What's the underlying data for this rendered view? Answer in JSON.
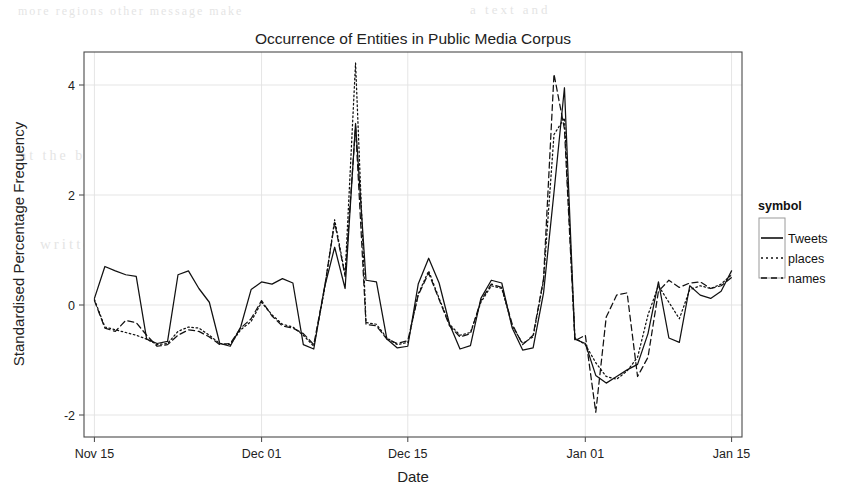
{
  "chart_data": {
    "type": "line",
    "title": "Occurrence of Entities in Public Media Corpus",
    "xlabel": "Date",
    "ylabel": "Standardised Percentage Frequency",
    "grid": true,
    "legend_position": "right",
    "legend_title": "symbol",
    "ylim": [
      -2.4,
      4.6
    ],
    "yticks": [
      -2,
      0,
      2,
      4
    ],
    "ytick_labels": [
      "-2",
      "0",
      "2",
      "4"
    ],
    "xticks": [
      "Nov 15",
      "Dec 01",
      "Dec 15",
      "Jan 01",
      "Jan 15"
    ],
    "xtick_days": [
      0,
      16,
      30,
      47,
      61
    ],
    "xlim_days": [
      -1,
      62
    ],
    "x_days": [
      0,
      1,
      2,
      3,
      4,
      5,
      6,
      7,
      8,
      9,
      10,
      11,
      12,
      13,
      14,
      15,
      16,
      17,
      18,
      19,
      20,
      21,
      22,
      23,
      24,
      25,
      26,
      27,
      28,
      29,
      30,
      31,
      32,
      33,
      34,
      35,
      36,
      37,
      38,
      39,
      40,
      41,
      42,
      43,
      44,
      45,
      46,
      47,
      48,
      49,
      50,
      51,
      52,
      53,
      54,
      55,
      56,
      57,
      58,
      59,
      60,
      61
    ],
    "series": [
      {
        "name": "Tweets",
        "style": "solid",
        "color": "#111111",
        "values": [
          0.12,
          0.7,
          0.62,
          0.55,
          0.52,
          -0.62,
          -0.7,
          -0.66,
          0.55,
          0.62,
          0.3,
          0.05,
          -0.7,
          -0.75,
          -0.4,
          0.28,
          0.42,
          0.38,
          0.48,
          0.4,
          -0.72,
          -0.8,
          0.3,
          1.05,
          0.3,
          3.3,
          0.45,
          0.42,
          -0.62,
          -0.78,
          -0.75,
          0.38,
          0.85,
          0.4,
          -0.35,
          -0.8,
          -0.74,
          0.12,
          0.45,
          0.4,
          -0.42,
          -0.82,
          -0.78,
          0.22,
          2.05,
          3.95,
          -0.62,
          -0.7,
          -1.28,
          -1.42,
          -1.3,
          -1.18,
          -1.08,
          -0.52,
          0.42,
          -0.6,
          -0.68,
          0.35,
          0.18,
          0.12,
          0.25,
          0.62
        ]
      },
      {
        "name": "places",
        "style": "dotted",
        "color": "#111111",
        "values": [
          0.1,
          -0.4,
          -0.45,
          -0.5,
          -0.55,
          -0.62,
          -0.72,
          -0.7,
          -0.48,
          -0.4,
          -0.42,
          -0.55,
          -0.7,
          -0.72,
          -0.45,
          -0.3,
          0.05,
          -0.18,
          -0.35,
          -0.4,
          -0.55,
          -0.75,
          0.25,
          1.55,
          0.55,
          4.4,
          -0.32,
          -0.35,
          -0.6,
          -0.72,
          -0.68,
          0.2,
          0.62,
          0.12,
          -0.35,
          -0.55,
          -0.5,
          0.05,
          0.35,
          0.3,
          -0.38,
          -0.7,
          -0.58,
          0.45,
          3.1,
          3.4,
          -0.6,
          -0.72,
          -1.05,
          -1.3,
          -1.35,
          -1.2,
          -0.95,
          -0.18,
          0.35,
          0.05,
          -0.25,
          0.28,
          0.35,
          0.3,
          0.38,
          0.55
        ]
      },
      {
        "name": "names",
        "style": "dashed",
        "color": "#111111",
        "values": [
          0.08,
          -0.42,
          -0.48,
          -0.28,
          -0.32,
          -0.55,
          -0.75,
          -0.72,
          -0.55,
          -0.45,
          -0.48,
          -0.58,
          -0.72,
          -0.7,
          -0.42,
          -0.25,
          0.08,
          -0.2,
          -0.38,
          -0.42,
          -0.52,
          -0.72,
          0.28,
          1.5,
          0.52,
          3.25,
          -0.35,
          -0.38,
          -0.62,
          -0.7,
          -0.65,
          0.18,
          0.58,
          0.1,
          -0.38,
          -0.58,
          -0.52,
          0.08,
          0.38,
          0.32,
          -0.35,
          -0.72,
          -0.55,
          0.48,
          4.2,
          3.2,
          -0.65,
          -0.55,
          -1.95,
          -0.22,
          0.18,
          0.22,
          -1.3,
          -0.95,
          0.25,
          0.45,
          0.32,
          0.4,
          0.42,
          0.3,
          0.35,
          0.5
        ]
      }
    ]
  },
  "legend": {
    "title": "symbol",
    "entries": [
      {
        "label": "Tweets",
        "style": "solid"
      },
      {
        "label": "places",
        "style": "dotted"
      },
      {
        "label": "names",
        "style": "dashed"
      }
    ]
  },
  "artifacts": {
    "note": "scanned page bleed-through",
    "fragments": [
      "more  regions  other  message  make",
      "a  text  and",
      "at  the  by  the  the  and  in  the",
      "us  of  P  and  to",
      "written  for  chart",
      "the",
      "O  l(",
      "n",
      "d  )  a"
    ]
  }
}
